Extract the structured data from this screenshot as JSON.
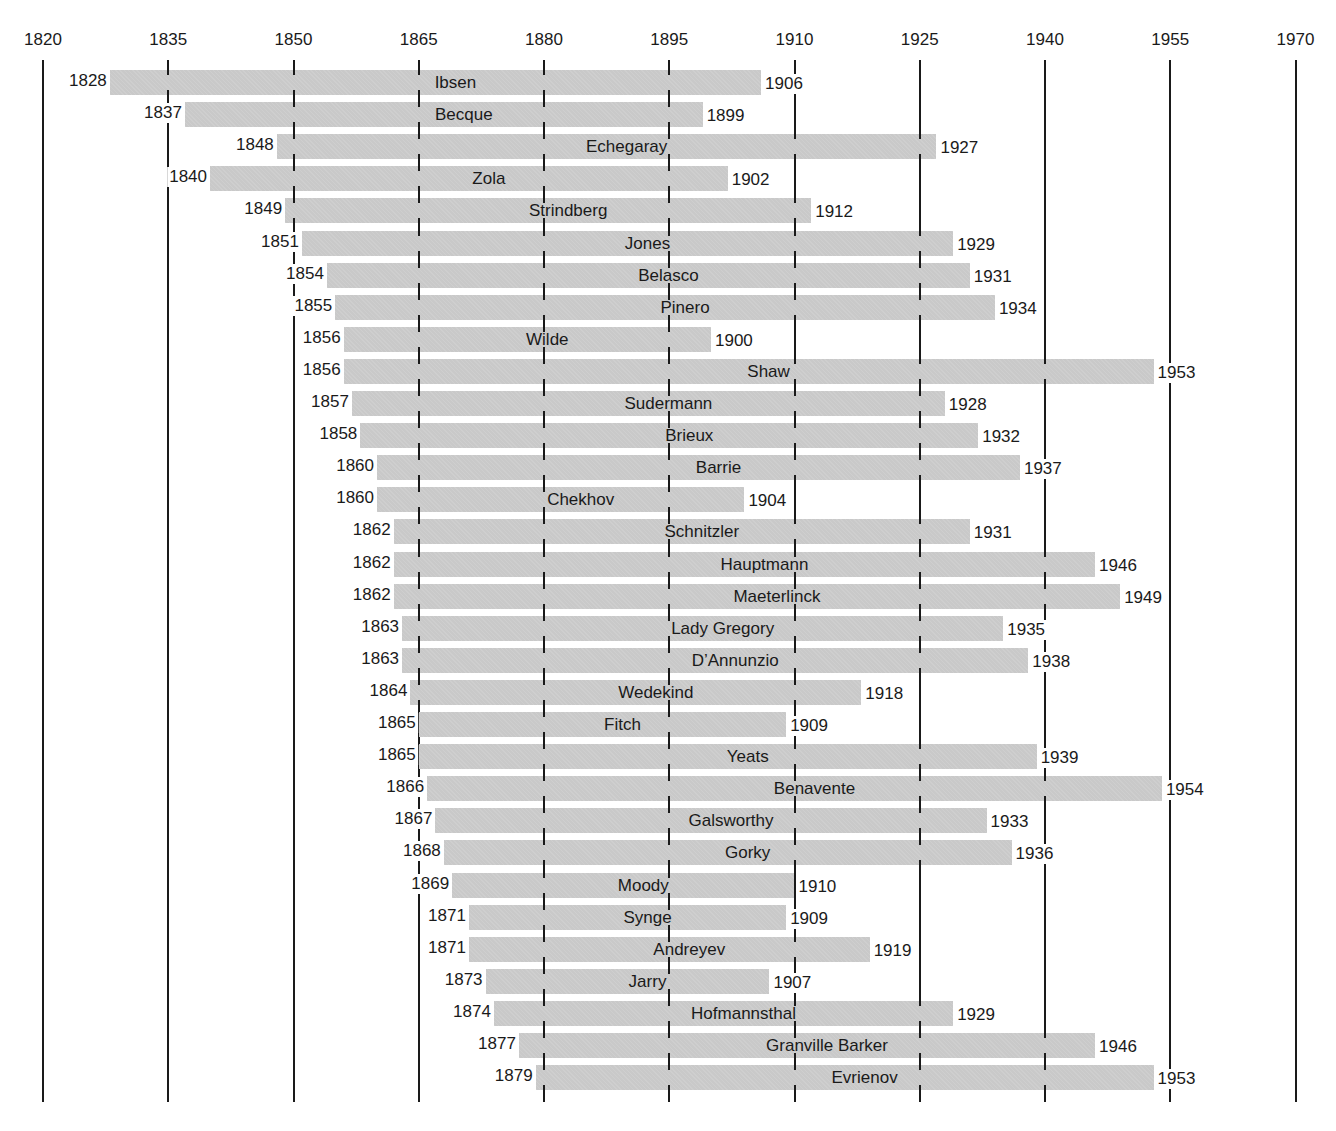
{
  "chart_data": {
    "type": "bar",
    "orientation": "horizontal-range",
    "title": "",
    "xlabel": "",
    "ylabel": "",
    "xlim": [
      1820,
      1970
    ],
    "grid": true,
    "axis_ticks": [
      1820,
      1835,
      1850,
      1865,
      1880,
      1895,
      1910,
      1925,
      1940,
      1955,
      1970
    ],
    "bar_color": "#c9c9c9",
    "line_color": "#1a1a1a",
    "series": [
      {
        "name": "Ibsen",
        "start": 1828,
        "end": 1906
      },
      {
        "name": "Becque",
        "start": 1837,
        "end": 1899
      },
      {
        "name": "Echegaray",
        "start": 1848,
        "end": 1927
      },
      {
        "name": "Zola",
        "start": 1840,
        "end": 1902
      },
      {
        "name": "Strindberg",
        "start": 1849,
        "end": 1912
      },
      {
        "name": "Jones",
        "start": 1851,
        "end": 1929
      },
      {
        "name": "Belasco",
        "start": 1854,
        "end": 1931
      },
      {
        "name": "Pinero",
        "start": 1855,
        "end": 1934
      },
      {
        "name": "Wilde",
        "start": 1856,
        "end": 1900
      },
      {
        "name": "Shaw",
        "start": 1856,
        "end": 1953
      },
      {
        "name": "Sudermann",
        "start": 1857,
        "end": 1928
      },
      {
        "name": "Brieux",
        "start": 1858,
        "end": 1932
      },
      {
        "name": "Barrie",
        "start": 1860,
        "end": 1937
      },
      {
        "name": "Chekhov",
        "start": 1860,
        "end": 1904
      },
      {
        "name": "Schnitzler",
        "start": 1862,
        "end": 1931
      },
      {
        "name": "Hauptmann",
        "start": 1862,
        "end": 1946
      },
      {
        "name": "Maeterlinck",
        "start": 1862,
        "end": 1949
      },
      {
        "name": "Lady Gregory",
        "start": 1863,
        "end": 1935
      },
      {
        "name": "D’Annunzio",
        "start": 1863,
        "end": 1938
      },
      {
        "name": "Wedekind",
        "start": 1864,
        "end": 1918
      },
      {
        "name": "Fitch",
        "start": 1865,
        "end": 1909
      },
      {
        "name": "Yeats",
        "start": 1865,
        "end": 1939
      },
      {
        "name": "Benavente",
        "start": 1866,
        "end": 1954
      },
      {
        "name": "Galsworthy",
        "start": 1867,
        "end": 1933
      },
      {
        "name": "Gorky",
        "start": 1868,
        "end": 1936
      },
      {
        "name": "Moody",
        "start": 1869,
        "end": 1910
      },
      {
        "name": "Synge",
        "start": 1871,
        "end": 1909
      },
      {
        "name": "Andreyev",
        "start": 1871,
        "end": 1919
      },
      {
        "name": "Jarry",
        "start": 1873,
        "end": 1907
      },
      {
        "name": "Hofmannsthal",
        "start": 1874,
        "end": 1929
      },
      {
        "name": "Granville Barker",
        "start": 1877,
        "end": 1946
      },
      {
        "name": "Evrienov",
        "start": 1879,
        "end": 1953
      }
    ]
  }
}
